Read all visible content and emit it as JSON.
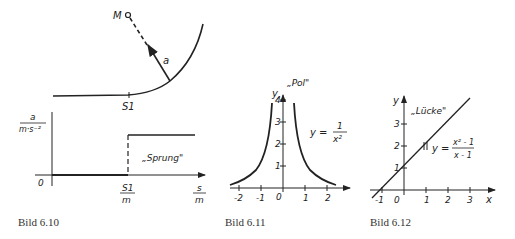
{
  "figures": [
    {
      "caption": "Bild 6.10",
      "top": {
        "point_label": "M",
        "vector_label": "a",
        "tick_label": "S1"
      },
      "bottom": {
        "y_label_num": "a",
        "y_label_den": "m·s⁻²",
        "origin": "0",
        "s1_num": "S1",
        "s1_den": "m",
        "x_num": "s",
        "x_den": "m",
        "annotation": "„Sprung\""
      }
    },
    {
      "caption": "Bild 6.11",
      "y_axis": "y",
      "annotation": "„Pol\"",
      "eq_lhs": "y =",
      "eq_num": "1",
      "eq_den": "x²",
      "x_ticks": [
        "-2",
        "-1",
        "0",
        "1",
        "2"
      ],
      "y_ticks": [
        "1",
        "2",
        "3",
        "4"
      ]
    },
    {
      "caption": "Bild 6.12",
      "y_axis": "y",
      "x_axis": "x",
      "annotation": "„Lücke\"",
      "eq_lhs": "y =",
      "eq_num": "x² - 1",
      "eq_den": "x - 1",
      "x_ticks": [
        "-1",
        "0",
        "1",
        "2",
        "3"
      ],
      "y_ticks": [
        "1",
        "2",
        "3"
      ]
    }
  ]
}
